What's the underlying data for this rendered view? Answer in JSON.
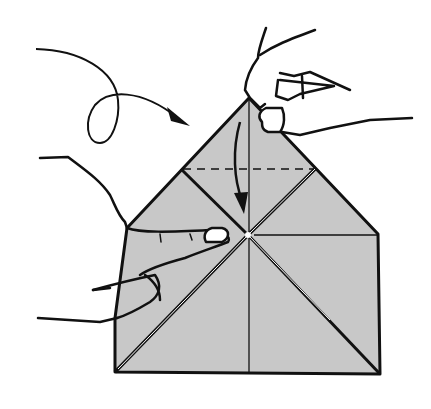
{
  "diagram": {
    "type": "origami-instruction",
    "description": "Hands folding the top point of a square-based paper model down to the center along a dashed valley-fold line",
    "colors": {
      "paper": "#c8c8c8",
      "ink": "#111111",
      "background": "#ffffff",
      "crease_highlight": "#ffffff"
    },
    "elements": [
      {
        "name": "paper-model",
        "shape": "pentagon (square base with triangular top)"
      },
      {
        "name": "valley-fold-line",
        "style": "dashed",
        "orientation": "horizontal"
      },
      {
        "name": "fold-down-arrow",
        "direction": "down",
        "target": "center point"
      },
      {
        "name": "turn-over-arrow",
        "style": "looping curved arrow",
        "direction": "right"
      },
      {
        "name": "right-hand",
        "action": "pinching top point"
      },
      {
        "name": "left-hand",
        "action": "holding center"
      }
    ]
  }
}
